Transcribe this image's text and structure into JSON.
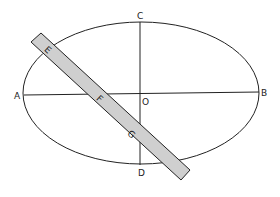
{
  "diagram": {
    "labels": {
      "A": "A",
      "B": "B",
      "C": "C",
      "D": "D",
      "O": "O",
      "E": "E",
      "F": "F",
      "G": "G"
    },
    "colors": {
      "stroke": "#222222",
      "strip_fill": "#cfcfcf",
      "background": "#ffffff"
    }
  }
}
